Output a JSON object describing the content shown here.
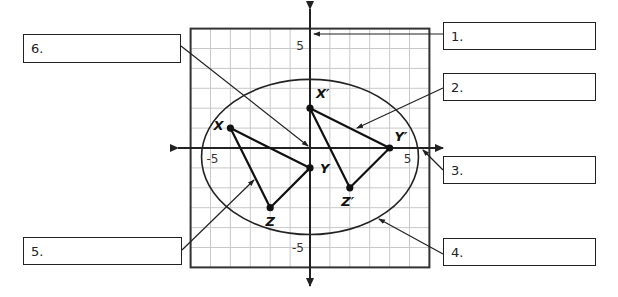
{
  "diagram": {
    "type": "coordinate-plane-transformation",
    "grid": {
      "x_range": [
        -6,
        6
      ],
      "y_range": [
        -6,
        6
      ],
      "step": 1
    },
    "axis_tick_labels": {
      "x_negative": "-5",
      "x_positive": "5",
      "y_positive": "5",
      "y_negative": "-5"
    },
    "preimage": {
      "name": "triangle XYZ",
      "points": [
        {
          "name": "X",
          "label": "X",
          "x": -4,
          "y": 1
        },
        {
          "name": "Y",
          "label": "Y",
          "x": 0,
          "y": -1
        },
        {
          "name": "Z",
          "label": "Z",
          "x": -2,
          "y": -3
        }
      ]
    },
    "image": {
      "name": "triangle X'Y'Z'",
      "points": [
        {
          "name": "X'",
          "label": "X′",
          "x": 0,
          "y": 2
        },
        {
          "name": "Y'",
          "label": "Y′",
          "x": 4,
          "y": 0
        },
        {
          "name": "Z'",
          "label": "Z′",
          "x": 2,
          "y": -2
        }
      ]
    },
    "ellipse": {
      "cx": 0,
      "cy": -0.45,
      "rx": 5.45,
      "ry": 3.9
    },
    "callouts": [
      {
        "id": 1,
        "text": "1.",
        "points_to": "y-axis"
      },
      {
        "id": 2,
        "text": "2.",
        "points_to": "segment X'Y'"
      },
      {
        "id": 3,
        "text": "3.",
        "points_to": "x-axis"
      },
      {
        "id": 4,
        "text": "4.",
        "points_to": "ellipse"
      },
      {
        "id": 5,
        "text": "5.",
        "points_to": "segment XZ"
      },
      {
        "id": 6,
        "text": "6.",
        "points_to": "origin"
      }
    ]
  }
}
